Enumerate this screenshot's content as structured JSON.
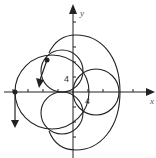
{
  "diagram": {
    "type": "polar-curve-plot",
    "axes": {
      "x_label": "x",
      "y_label": "y",
      "x_tick_label": "4",
      "y_tick_label": "4"
    },
    "curves": [
      {
        "name": "outer-loop",
        "description": "large outer curve through top, right, bottom"
      },
      {
        "name": "left-circle",
        "description": "large left circle through leftmost point on x-axis"
      },
      {
        "name": "upper-left-circle",
        "description": "small circle in second quadrant"
      },
      {
        "name": "lower-left-circle",
        "description": "small circle below x-axis"
      },
      {
        "name": "right-circle",
        "description": "small circle on positive x-axis"
      }
    ],
    "points": [
      {
        "name": "point-on-x-axis",
        "has_arrow": true,
        "arrow_direction": "down"
      },
      {
        "name": "point-on-upper-circle",
        "has_arrow": true,
        "arrow_direction": "down-left"
      }
    ],
    "colors": {
      "stroke": "#222222",
      "background": "#ffffff"
    }
  }
}
